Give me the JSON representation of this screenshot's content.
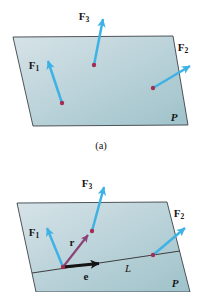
{
  "figure_a": {
    "caption": "(a)",
    "plane_label": "P",
    "forces": {
      "f1": {
        "base": "F",
        "sub": "1"
      },
      "f2": {
        "base": "F",
        "sub": "2"
      },
      "f3": {
        "base": "F",
        "sub": "3"
      }
    }
  },
  "figure_b": {
    "plane_label": "P",
    "line_label": "L",
    "r_label": "r",
    "e_label": "e",
    "forces": {
      "f1": {
        "base": "F",
        "sub": "1"
      },
      "f2": {
        "base": "F",
        "sub": "2"
      },
      "f3": {
        "base": "F",
        "sub": "3"
      }
    }
  },
  "colors": {
    "plane_light": "#d6e3e8",
    "plane_dark": "#9fc2ca",
    "edge": "#3c4347",
    "force_arrow": "#3fb2e5",
    "point": "#a52d52",
    "r_arrow": "#8c4377",
    "e_arrow": "#141414",
    "line": "#2c2c2c",
    "text": "#161616"
  }
}
